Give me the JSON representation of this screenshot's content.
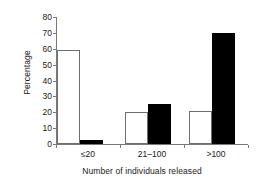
{
  "chart_data": {
    "type": "bar",
    "title": "",
    "xlabel": "Number of individuals released",
    "ylabel": "Percentage",
    "categories": [
      "≤20",
      "21–100",
      ">100"
    ],
    "series": [
      {
        "name": "open",
        "fill": "white",
        "values": [
          59,
          20,
          21
        ]
      },
      {
        "name": "filled",
        "fill": "black",
        "values": [
          2.5,
          25.5,
          70
        ]
      }
    ],
    "ylim": [
      0,
      80
    ],
    "yticks": [
      0,
      10,
      20,
      30,
      40,
      50,
      60,
      70,
      80
    ],
    "ytick_labels": [
      "0",
      "10",
      "20",
      "30",
      "40",
      "50",
      "60",
      "70",
      "80"
    ],
    "grid": false,
    "legend": "none",
    "colors": {
      "open_bar_fill": "#ffffff",
      "open_bar_stroke": "#6e6e6e",
      "filled_bar_fill": "#000000",
      "axis": "#7a7a7a",
      "text": "#1a1a1a",
      "background": "#ffffff"
    }
  }
}
